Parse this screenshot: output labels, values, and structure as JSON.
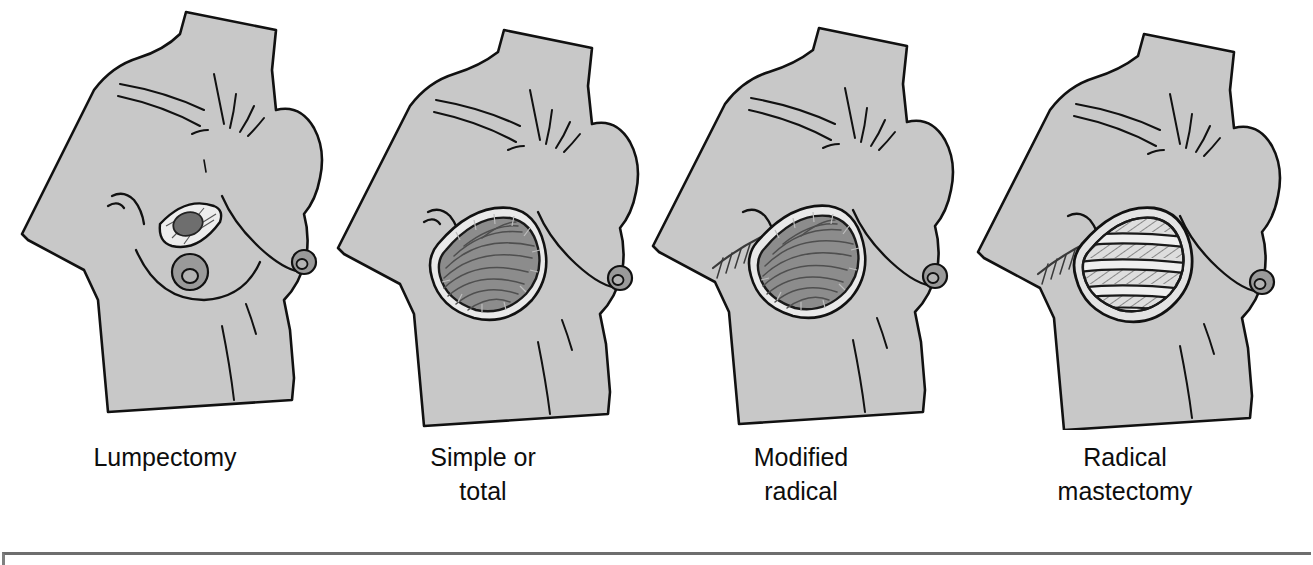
{
  "figure": {
    "kind": "medical-illustration",
    "body_fill": "#c8c8c8",
    "outline_color": "#111111",
    "muscle_fill": "#8c8c8c",
    "muscle_fiber_color": "#4a4a4a",
    "skin_edge_fill": "#e9e9e9",
    "tumor_fill": "#6e6e6e",
    "nipple_fill": "#8f8f8f",
    "rib_fill": "#eaeaea",
    "background": "#ffffff",
    "frame_color": "#6e6e6e"
  },
  "panels": [
    {
      "id": "lumpectomy",
      "caption_line1": "Lumpectomy",
      "caption_line2": "",
      "features": [
        "left-breast-intact",
        "right-breast-intact",
        "small-elliptical-incision",
        "tumor-excised",
        "nipple-areola-preserved"
      ]
    },
    {
      "id": "simple-or-total",
      "caption_line1": "Simple or",
      "caption_line2": "total",
      "features": [
        "breast-removed",
        "pectoral-muscle-exposed",
        "skin-flap-edge",
        "nipple-removed"
      ]
    },
    {
      "id": "modified-radical",
      "caption_line1": "Modified",
      "caption_line2": "radical",
      "features": [
        "breast-removed",
        "pectoral-muscle-exposed",
        "axillary-suture-line",
        "lymph-nodes-removed"
      ]
    },
    {
      "id": "radical-mastectomy",
      "caption_line1": "Radical",
      "caption_line2": "mastectomy",
      "features": [
        "breast-removed",
        "pectoral-muscle-removed",
        "ribs-exposed",
        "intercostal-muscle-visible",
        "axillary-suture-line"
      ]
    }
  ]
}
